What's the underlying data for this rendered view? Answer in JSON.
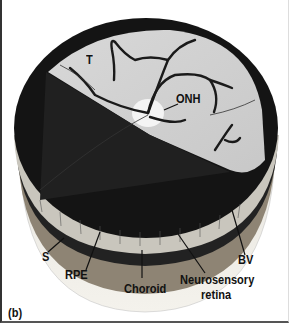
{
  "figure": {
    "panel_label": "(b)",
    "labels": {
      "temporal": "T",
      "optic_nerve_head": "ONH",
      "sclera": "S",
      "rpe": "RPE",
      "choroid": "Choroid",
      "neurosensory_retina_line1": "Neurosensory",
      "neurosensory_retina_line2": "retina",
      "blood_vessel": "BV"
    }
  }
}
